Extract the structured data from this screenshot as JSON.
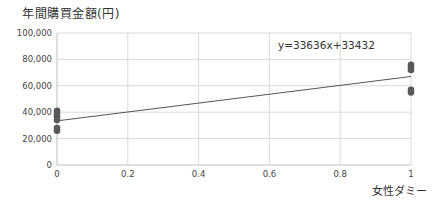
{
  "chart_data": {
    "type": "scatter",
    "title": "",
    "ylabel": "年間購買金額(円)",
    "xlabel": "女性ダミー",
    "xlim": [
      0,
      1
    ],
    "ylim": [
      0,
      100000
    ],
    "xticks": [
      0,
      0.2,
      0.4,
      0.6,
      0.8,
      1
    ],
    "xtick_labels": [
      "0",
      "0.2",
      "0.4",
      "0.6",
      "0.8",
      "1"
    ],
    "yticks": [
      0,
      20000,
      40000,
      60000,
      80000,
      100000
    ],
    "ytick_labels": [
      "0",
      "20,000",
      "40,000",
      "60,000",
      "80,000",
      "100,000"
    ],
    "grid": true,
    "series": [
      {
        "name": "data",
        "points": [
          {
            "x": 0,
            "y": 41000
          },
          {
            "x": 0,
            "y": 39000
          },
          {
            "x": 0,
            "y": 37000
          },
          {
            "x": 0,
            "y": 34000
          },
          {
            "x": 0,
            "y": 28000
          },
          {
            "x": 0,
            "y": 26000
          },
          {
            "x": 1,
            "y": 76000
          },
          {
            "x": 1,
            "y": 74000
          },
          {
            "x": 1,
            "y": 72000
          },
          {
            "x": 1,
            "y": 57000
          },
          {
            "x": 1,
            "y": 55000
          }
        ]
      }
    ],
    "trendline": {
      "type": "linear",
      "slope": 33636,
      "intercept": 33432,
      "equation_label": "y=33636x+33432"
    },
    "colors": {
      "points": "#595959",
      "trendline": "#555555",
      "grid": "#d9d9d9",
      "axis": "#bfbfbf"
    }
  }
}
